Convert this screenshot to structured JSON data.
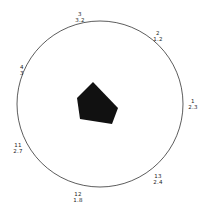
{
  "diagram": {
    "circle": {
      "cx": 100,
      "cy": 104,
      "r": 83,
      "stroke": "#333333"
    },
    "polygon": {
      "fill": "#111111",
      "points": [
        [
          93,
          82
        ],
        [
          118,
          108
        ],
        [
          112,
          124
        ],
        [
          80,
          119
        ],
        [
          77,
          98
        ]
      ]
    },
    "labels": [
      {
        "id": "3",
        "value": "3.2",
        "x": 72,
        "y": 11
      },
      {
        "id": "2",
        "value": "1.2",
        "x": 150,
        "y": 30
      },
      {
        "id": "1",
        "value": "2.3",
        "x": 185,
        "y": 98
      },
      {
        "id": "13",
        "value": "2.4",
        "x": 150,
        "y": 173
      },
      {
        "id": "12",
        "value": "1.8",
        "x": 70,
        "y": 191
      },
      {
        "id": "11",
        "value": "2.7",
        "x": 10,
        "y": 142
      },
      {
        "id": "4",
        "value": "3",
        "x": 14,
        "y": 64
      }
    ]
  }
}
